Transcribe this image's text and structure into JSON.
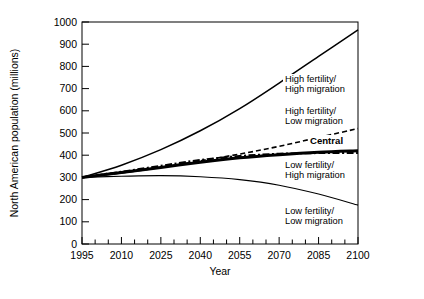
{
  "chart_data": {
    "type": "line",
    "title": "",
    "xlabel": "Year",
    "ylabel": "North American population (millions)",
    "xlim": [
      1995,
      2100
    ],
    "ylim": [
      0,
      1000
    ],
    "grid": false,
    "legend_position": "inline-right",
    "xticks_major": [
      "1995",
      "2010",
      "2025",
      "2040",
      "2055",
      "2070",
      "2085",
      "2100"
    ],
    "xtick_minor_step": 5,
    "yticks": [
      "0",
      "100",
      "200",
      "300",
      "400",
      "500",
      "600",
      "700",
      "800",
      "900",
      "1000"
    ],
    "x": [
      1995,
      2010,
      2025,
      2040,
      2055,
      2070,
      2085,
      2100
    ],
    "series": [
      {
        "name": "High fertility/ High migration",
        "label_line1": "High fertility/",
        "label_line2": "High migration",
        "style": "solid",
        "width": 1.5,
        "values": [
          300,
          355,
          425,
          510,
          610,
          725,
          845,
          965
        ]
      },
      {
        "name": "High fertility/ Low migration",
        "label_line1": "High fertility/",
        "label_line2": "Low migration",
        "style": "dashed",
        "width": 1.6,
        "values": [
          300,
          320,
          345,
          375,
          405,
          440,
          480,
          520
        ]
      },
      {
        "name": "Central",
        "label_line1": "Central",
        "label_line2": "",
        "style": "solid-bold",
        "width": 3.0,
        "values": [
          300,
          322,
          345,
          368,
          388,
          402,
          413,
          420
        ]
      },
      {
        "name": "Low fertility/ High migration",
        "label_line1": "Low fertility/",
        "label_line2": "High migration",
        "style": "dash-dot",
        "width": 2.2,
        "values": [
          300,
          325,
          352,
          378,
          396,
          406,
          410,
          410
        ]
      },
      {
        "name": "Low fertility/ Low migration",
        "label_line1": "Low fertility/",
        "label_line2": "Low migration",
        "style": "solid",
        "width": 1.1,
        "values": [
          300,
          305,
          308,
          303,
          290,
          265,
          225,
          175
        ]
      }
    ],
    "colors": {
      "axis": "#000000",
      "line": "#000000",
      "background": "#ffffff"
    }
  }
}
